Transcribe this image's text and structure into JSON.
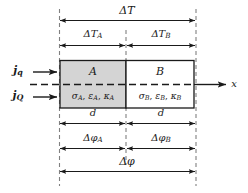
{
  "figure": {
    "type": "schematic-diagram",
    "colors": {
      "region_a_fill": "#d4d4d4",
      "region_b_fill": "#ffffff",
      "outline": "#1a1a1a",
      "dashed_guide": "#777777",
      "arrow": "#1a1a1a",
      "background": "#ffffff"
    }
  },
  "regions": {
    "a": {
      "name": "A",
      "properties": "σ",
      "props_full": "σA, εA, κA",
      "sigma": "σ",
      "eps": "ε",
      "kappa": "κ",
      "sub": "A"
    },
    "b": {
      "name": "B",
      "properties": "σ",
      "props_full": "σB, εB, κB",
      "sigma": "σ",
      "eps": "ε",
      "kappa": "κ",
      "sub": "B"
    }
  },
  "fluxes": {
    "heat": {
      "symbol": "j",
      "sub": "q",
      "label": "jq"
    },
    "charge": {
      "symbol": "j",
      "sub": "Q",
      "label": "jQ"
    }
  },
  "axis": {
    "label": "x"
  },
  "annotations": {
    "delta_t_total": {
      "base": "ΔT",
      "sub": "",
      "label": "ΔT"
    },
    "delta_t_a": {
      "base": "ΔT",
      "sub": "A",
      "label": "ΔTA"
    },
    "delta_t_b": {
      "base": "ΔT",
      "sub": "B",
      "label": "ΔTB"
    },
    "thickness_a": {
      "base": "d",
      "sub": "",
      "label": "d"
    },
    "thickness_b": {
      "base": "d",
      "sub": "",
      "label": "d"
    },
    "delta_phi_a": {
      "base": "Δφ",
      "sub": "A",
      "label": "ΔφA"
    },
    "delta_phi_b": {
      "base": "Δφ",
      "sub": "B",
      "label": "ΔφB"
    },
    "delta_phi_total": {
      "base": "Δφ",
      "sub": "",
      "label": "Δφ"
    }
  }
}
